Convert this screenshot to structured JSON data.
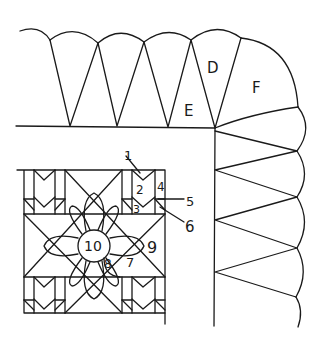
{
  "diagram": {
    "type": "quilt-pattern-sketch",
    "ink_color": "#1a1a1a",
    "background": "#ffffff",
    "border_labels": {
      "D": "D",
      "E": "E",
      "F": "F"
    },
    "block_labels": {
      "l1": "1",
      "l2": "2",
      "l3": "3",
      "l4": "4",
      "l5": "5",
      "l6": "6",
      "l7": "7",
      "l8": "8",
      "l9": "9",
      "l10": "10"
    }
  }
}
